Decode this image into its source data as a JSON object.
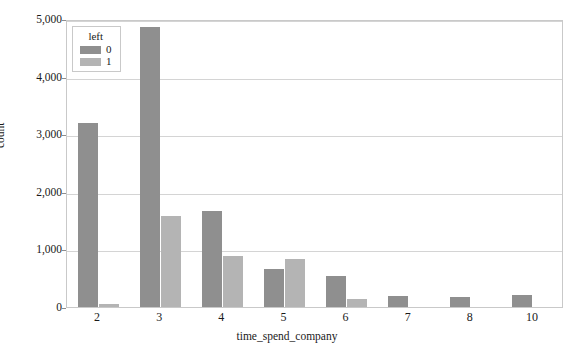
{
  "chart_data": {
    "type": "bar",
    "title": "",
    "xlabel": "time_spend_company",
    "ylabel": "count",
    "categories": [
      "2",
      "3",
      "4",
      "5",
      "6",
      "7",
      "8",
      "10"
    ],
    "series": [
      {
        "name": "0",
        "color": "#8f8f8f",
        "values": [
          3191,
          4857,
          1667,
          667,
          530,
          198,
          168,
          214
        ]
      },
      {
        "name": "1",
        "color": "#b4b4b4",
        "values": [
          53,
          1586,
          890,
          833,
          145,
          0,
          0,
          0
        ]
      }
    ],
    "legend": {
      "title": "left",
      "position": "top-left",
      "entries": [
        "0",
        "1"
      ]
    },
    "ylim": [
      0,
      5000
    ],
    "yticks": [
      0,
      1000,
      2000,
      3000,
      4000,
      5000
    ],
    "ytick_labels": [
      "0",
      "1,000",
      "2,000",
      "3,000",
      "4,000",
      "5,000"
    ],
    "grid": true,
    "grid_axis": "y"
  }
}
